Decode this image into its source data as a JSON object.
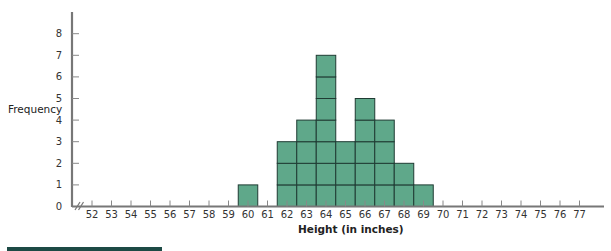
{
  "chart_data": {
    "type": "bar",
    "subtype": "histogram-dot-stack",
    "title": "",
    "xlabel": "Height (in inches)",
    "ylabel": "Frequency",
    "categories": [
      52,
      53,
      54,
      55,
      56,
      57,
      58,
      59,
      60,
      61,
      62,
      63,
      64,
      65,
      66,
      67,
      68,
      69,
      70,
      71,
      72,
      73,
      74,
      75,
      76,
      77
    ],
    "values": [
      0,
      0,
      0,
      0,
      0,
      0,
      0,
      0,
      1,
      0,
      3,
      4,
      7,
      3,
      5,
      4,
      2,
      1,
      0,
      0,
      0,
      0,
      0,
      0,
      0,
      0
    ],
    "ylim": [
      0,
      8
    ],
    "yticks": [
      0,
      1,
      2,
      3,
      4,
      5,
      6,
      7,
      8
    ],
    "xticks": [
      52,
      53,
      54,
      55,
      56,
      57,
      58,
      59,
      60,
      61,
      62,
      63,
      64,
      65,
      66,
      67,
      68,
      69,
      70,
      71,
      72,
      73,
      74,
      75,
      76,
      77
    ],
    "axis_break": true,
    "grid": false,
    "legend": null,
    "bar_color": "#5fa88a",
    "bar_edge_color": "#1f3b33",
    "stacked_unit_cells": true
  },
  "decor": {
    "footer_bar_color": "#1d4a45"
  }
}
